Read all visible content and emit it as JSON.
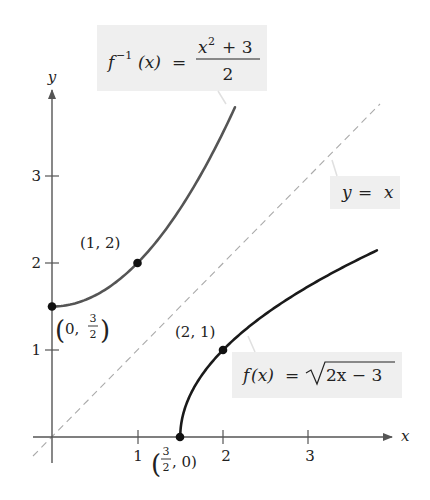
{
  "chart_data": {
    "type": "line",
    "title": "",
    "xlabel": "x",
    "ylabel": "y",
    "xlim": [
      -0.22,
      3.95
    ],
    "ylim": [
      -0.3,
      3.98
    ],
    "grid": false,
    "x_ticks": [
      1,
      2,
      3
    ],
    "x_tick_labels": [
      "1",
      "2",
      "3"
    ],
    "y_ticks": [
      1,
      2,
      3
    ],
    "y_tick_labels": [
      "1",
      "2",
      "3"
    ],
    "series": [
      {
        "name": "f(x) = √(2x − 3)",
        "function": "sqrt(2x-3)",
        "domain": [
          1.5,
          3.8
        ],
        "color": "#1a1a1a",
        "style": "solid",
        "x": [
          1.5,
          1.55,
          1.6,
          1.7,
          1.8,
          2.0,
          2.25,
          2.5,
          2.75,
          3.0,
          3.25,
          3.5,
          3.8
        ],
        "y": [
          0,
          0.32,
          0.45,
          0.63,
          0.77,
          1.0,
          1.22,
          1.41,
          1.58,
          1.73,
          1.87,
          2.0,
          2.14
        ]
      },
      {
        "name": "f⁻¹(x) = (x² + 3)/2",
        "function": "(x^2+3)/2",
        "domain": [
          0,
          2.14
        ],
        "color": "#555555",
        "style": "solid",
        "x": [
          0,
          0.25,
          0.5,
          0.75,
          1.0,
          1.25,
          1.5,
          1.75,
          2.0,
          2.14
        ],
        "y": [
          1.5,
          1.53,
          1.63,
          1.78,
          2.0,
          2.28,
          2.63,
          3.03,
          3.5,
          3.79
        ]
      },
      {
        "name": "y = x",
        "function": "x",
        "domain": [
          -0.22,
          3.83
        ],
        "color": "#aaaaaa",
        "style": "dashed",
        "x": [
          -0.22,
          3.83
        ],
        "y": [
          -0.22,
          3.83
        ]
      }
    ],
    "points": [
      {
        "x": 0,
        "y": 1.5,
        "label": "(0, 3/2)"
      },
      {
        "x": 1,
        "y": 2,
        "label": "(1, 2)"
      },
      {
        "x": 2,
        "y": 1,
        "label": "(2, 1)"
      },
      {
        "x": 1.5,
        "y": 0,
        "label": "(3/2, 0)"
      }
    ],
    "annotations": [
      {
        "text": "f⁻¹(x) = (x² + 3)/2",
        "target": "inverse-curve"
      },
      {
        "text": "y = x",
        "target": "identity-line"
      },
      {
        "text": "f(x) = √(2x − 3)",
        "target": "f-curve"
      }
    ]
  },
  "labels": {
    "axis_x": "x",
    "axis_y": "y",
    "tick_x_1": "1",
    "tick_x_2": "2",
    "tick_x_3": "3",
    "tick_y_1": "1",
    "tick_y_2": "2",
    "tick_y_3": "3",
    "inverse": {
      "lhs_f": "f",
      "lhs_sup": "−1",
      "lhs_arg": "(x)",
      "eq": "=",
      "num_x": "x",
      "num_sup": "2",
      "num_rest": "+ 3",
      "den": "2"
    },
    "identity": {
      "y": "y",
      "eq": "=",
      "x": "x"
    },
    "func": {
      "f": "f",
      "arg": "(x)",
      "eq": "=",
      "radicand": "2x − 3"
    },
    "pt_1_2": "(1,  2)",
    "pt_2_1": "(2,  1)",
    "pt_0_32": {
      "open": "(0,",
      "num": "3",
      "den": "2",
      "close": ")"
    },
    "pt_32_0": {
      "open": "(",
      "num": "3",
      "den": "2",
      "rest": ",  0)"
    }
  }
}
